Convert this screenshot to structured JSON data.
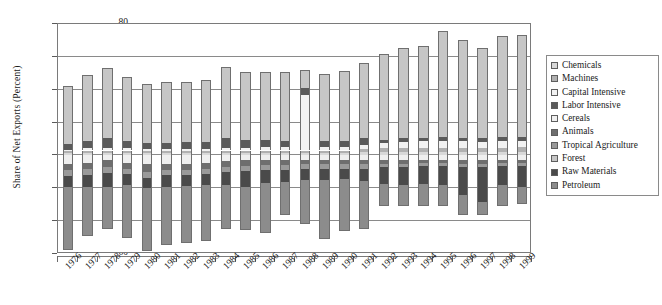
{
  "chart_data": {
    "type": "bar",
    "title": "",
    "xlabel": "",
    "ylabel": "Share of Net Exports (Percent)",
    "ylim": [
      -60,
      80
    ],
    "yticks": [
      80,
      60,
      40,
      20,
      0,
      -20,
      -40,
      -60
    ],
    "ytick_labels": [
      "80",
      "60",
      "40",
      "20",
      "0",
      "-20",
      "-40",
      "-60"
    ],
    "grid": true,
    "stacked": true,
    "legend_position": "right",
    "categories": [
      "1976",
      "1977",
      "1978",
      "1979",
      "1980",
      "1981",
      "1982",
      "1983",
      "1984",
      "1985",
      "1986",
      "1987",
      "1988",
      "1989",
      "1990",
      "1991",
      "1992",
      "1993",
      "1994",
      "1995",
      "1996",
      "1997",
      "1998",
      "1999"
    ],
    "series": [
      {
        "name": "Chemicals",
        "color": "#d8d8d8",
        "values": [
          1.5,
          1.5,
          1.5,
          1.5,
          1.5,
          1.5,
          1.5,
          1.5,
          1.5,
          1.5,
          1.5,
          1.5,
          1.5,
          1.5,
          1.5,
          2.0,
          2.0,
          2.0,
          2.0,
          2.0,
          2.0,
          2.0,
          2.0,
          2.0
        ]
      },
      {
        "name": "Machines",
        "color": "#b0b0b0",
        "values": [
          1.0,
          1.5,
          1.5,
          1.5,
          1.0,
          1.0,
          1.0,
          1.0,
          1.5,
          1.5,
          1.5,
          1.5,
          1.5,
          1.5,
          1.5,
          2.0,
          2.5,
          2.5,
          2.5,
          2.5,
          2.5,
          2.5,
          2.5,
          3.0
        ]
      },
      {
        "name": "Capital Intensive",
        "color": "#f2f2f2",
        "values": [
          1.0,
          1.5,
          1.5,
          1.5,
          1.5,
          1.5,
          1.5,
          1.5,
          1.5,
          1.5,
          2.0,
          2.0,
          34.0,
          2.0,
          2.0,
          2.5,
          3.0,
          3.5,
          4.0,
          4.0,
          4.0,
          3.5,
          4.0,
          4.0
        ]
      },
      {
        "name": "Labor Intensive",
        "color": "#5a5a5a",
        "values": [
          3.5,
          4.5,
          6.0,
          4.5,
          3.5,
          3.5,
          4.0,
          4.0,
          6.0,
          5.0,
          4.5,
          4.0,
          4.0,
          3.5,
          3.5,
          4.0,
          2.0,
          2.5,
          2.0,
          2.5,
          2.0,
          2.5,
          2.5,
          2.5
        ]
      },
      {
        "name": "Cereals",
        "color": "#efefef",
        "values": [
          -5.0,
          -4.5,
          -2.5,
          -4.5,
          -5.5,
          -5.0,
          -5.0,
          -4.5,
          -3.5,
          -3.0,
          -3.0,
          -3.0,
          -2.5,
          -2.5,
          -2.5,
          -2.5,
          -2.5,
          -2.5,
          -2.5,
          -2.5,
          -3.0,
          -3.0,
          -2.5,
          -2.5
        ]
      },
      {
        "name": "Animals",
        "color": "#6e6e6e",
        "values": [
          -4.0,
          -4.0,
          -4.5,
          -4.0,
          -4.5,
          -4.0,
          -4.0,
          -4.0,
          -3.5,
          -3.5,
          -3.0,
          -3.0,
          -3.0,
          -3.0,
          -3.0,
          -3.0,
          -2.5,
          -2.5,
          -2.0,
          -2.0,
          -2.0,
          -2.0,
          -2.0,
          -2.0
        ]
      },
      {
        "name": "Tropical Agriculture",
        "color": "#9a9a9a",
        "values": [
          -3.5,
          -3.5,
          -3.5,
          -3.0,
          -3.5,
          -3.0,
          -3.0,
          -3.0,
          -3.0,
          -3.0,
          -3.0,
          -3.0,
          -2.5,
          -2.5,
          -2.5,
          -2.5,
          -2.0,
          -2.0,
          -2.0,
          -2.0,
          -2.0,
          -2.0,
          -2.0,
          -2.0
        ]
      },
      {
        "name": "Forest",
        "color": "#c6c6c6",
        "values": [
          35.0,
          40.0,
          43.0,
          39.0,
          36.0,
          37.0,
          37.0,
          38.0,
          43.5,
          41.0,
          41.0,
          42.0,
          11.0,
          41.0,
          43.0,
          45.5,
          52.0,
          55.0,
          56.0,
          65.0,
          60.0,
          55.0,
          62.0,
          62.0
        ]
      },
      {
        "name": "Raw Materials",
        "color": "#4a4a4a",
        "values": [
          -7.0,
          -7.0,
          -8.5,
          -6.5,
          -6.5,
          -7.0,
          -6.5,
          -6.5,
          -8.0,
          -9.5,
          -7.5,
          -7.0,
          -7.0,
          -7.0,
          -6.5,
          -7.5,
          -10.5,
          -11.0,
          -11.0,
          -11.5,
          -17.0,
          -21.5,
          -11.5,
          -13.0
        ]
      },
      {
        "name": "Petroleum",
        "color": "#8c8c8c",
        "values": [
          -38.0,
          -30.0,
          -26.0,
          -32.0,
          -38.0,
          -35.5,
          -35.0,
          -34.0,
          -26.5,
          -26.5,
          -30.5,
          -20.5,
          -26.5,
          -36.0,
          -31.5,
          -29.0,
          -13.0,
          -13.0,
          -13.5,
          -12.5,
          -12.0,
          -8.0,
          -12.5,
          -10.0
        ]
      }
    ]
  },
  "legend": {
    "items": [
      {
        "label": "Chemicals",
        "color": "#d8d8d8"
      },
      {
        "label": "Machines",
        "color": "#b0b0b0"
      },
      {
        "label": "Capital Intensive",
        "color": "#f2f2f2"
      },
      {
        "label": "Labor Intensive",
        "color": "#5a5a5a"
      },
      {
        "label": "Cereals",
        "color": "#efefef"
      },
      {
        "label": "Animals",
        "color": "#6e6e6e"
      },
      {
        "label": "Tropical Agriculture",
        "color": "#9a9a9a"
      },
      {
        "label": "Forest",
        "color": "#c6c6c6"
      },
      {
        "label": "Raw Materials",
        "color": "#4a4a4a"
      },
      {
        "label": "Petroleum",
        "color": "#8c8c8c"
      }
    ]
  }
}
